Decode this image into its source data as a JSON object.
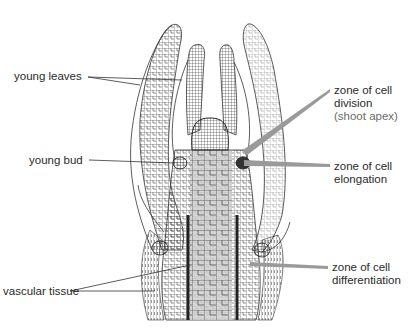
{
  "diagram": {
    "colors": {
      "background": "#ffffff",
      "cell_lines": "#3a3a3a",
      "pith_fill": "#cfcfcf",
      "zone_leader": "#9a9a9a",
      "label_text": "#2a2a2a",
      "sub_label_text": "#6a6a6a"
    },
    "labels_left": [
      {
        "id": "young-leaves",
        "text": "young leaves"
      },
      {
        "id": "young-bud",
        "text": "young bud"
      },
      {
        "id": "vascular-tissue",
        "text": "vascular tissue"
      }
    ],
    "labels_right": [
      {
        "id": "zone-division",
        "line1": "zone of cell",
        "line2": "division",
        "line3": "(shoot apex)"
      },
      {
        "id": "zone-elongation",
        "line1": "zone of cell",
        "line2": "elongation"
      },
      {
        "id": "zone-differentiation",
        "line1": "zone of cell",
        "line2": "differentiation"
      }
    ]
  }
}
